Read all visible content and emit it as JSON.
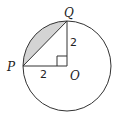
{
  "diagram": {
    "points": {
      "P": "P",
      "Q": "Q",
      "O": "O"
    },
    "lengths": {
      "OQ": "2",
      "PO": "2"
    },
    "colors": {
      "stroke": "#333333",
      "shaded": "#d4d4d4"
    }
  }
}
